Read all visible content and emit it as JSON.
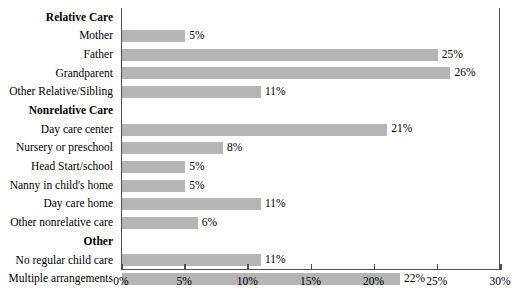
{
  "chart_data": {
    "type": "bar",
    "orientation": "horizontal",
    "title": "",
    "subtitle": "",
    "xlabel": "",
    "ylabel": "",
    "xlim": [
      0,
      30
    ],
    "xunit": "%",
    "grid": false,
    "legend": null,
    "bar_color": "#b5b5b5",
    "axis_color": "#4d4d4d",
    "xticks": [
      0,
      5,
      10,
      15,
      20,
      25,
      30
    ],
    "xtick_labels": [
      "0%",
      "5%",
      "10%",
      "15%",
      "20%",
      "25%",
      "30%"
    ],
    "categories": [
      "Relative Care",
      "Mother",
      "Father",
      "Grandparent",
      "Other Relative/Sibling",
      "Nonrelative Care",
      "Day care center",
      "Nursery or preschool",
      "Head Start/school",
      "Nanny in child's home",
      "Day care home",
      "Other nonrelative care",
      "Other",
      "No regular child care",
      "Multiple arrangements"
    ],
    "rows": [
      {
        "label": "Relative Care",
        "is_header": true,
        "value": null,
        "value_label": ""
      },
      {
        "label": "Mother",
        "is_header": false,
        "value": 5,
        "value_label": "5%"
      },
      {
        "label": "Father",
        "is_header": false,
        "value": 25,
        "value_label": "25%"
      },
      {
        "label": "Grandparent",
        "is_header": false,
        "value": 26,
        "value_label": "26%"
      },
      {
        "label": "Other Relative/Sibling",
        "is_header": false,
        "value": 11,
        "value_label": "11%"
      },
      {
        "label": "Nonrelative Care",
        "is_header": true,
        "value": null,
        "value_label": ""
      },
      {
        "label": "Day care center",
        "is_header": false,
        "value": 21,
        "value_label": "21%"
      },
      {
        "label": "Nursery or preschool",
        "is_header": false,
        "value": 8,
        "value_label": "8%"
      },
      {
        "label": "Head Start/school",
        "is_header": false,
        "value": 5,
        "value_label": "5%"
      },
      {
        "label": "Nanny in child's home",
        "is_header": false,
        "value": 5,
        "value_label": "5%"
      },
      {
        "label": "Day care home",
        "is_header": false,
        "value": 11,
        "value_label": "11%"
      },
      {
        "label": "Other nonrelative care",
        "is_header": false,
        "value": 6,
        "value_label": "6%"
      },
      {
        "label": "Other",
        "is_header": true,
        "value": null,
        "value_label": ""
      },
      {
        "label": "No regular child care",
        "is_header": false,
        "value": 11,
        "value_label": "11%"
      },
      {
        "label": "Multiple arrangements",
        "is_header": false,
        "value": 22,
        "value_label": "22%"
      }
    ]
  }
}
